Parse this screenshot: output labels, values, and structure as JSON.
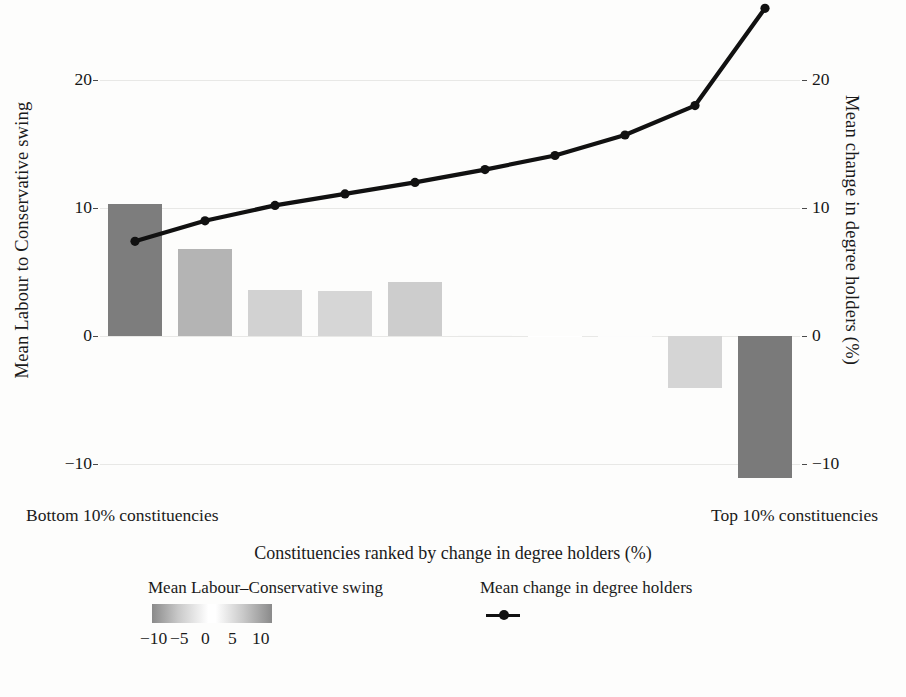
{
  "chart_data": {
    "type": "bar",
    "title": "",
    "subtitle": "",
    "xlabel": "Constituencies ranked by change in degree holders (%)",
    "ylabel_left": "Mean Labour to Conservative swing",
    "ylabel_right": "Mean change in degree holders (%)",
    "grid": true,
    "legend_position": "bottom",
    "x_end_labels": {
      "left": "Bottom 10% constituencies",
      "right": "Top 10% constituencies"
    },
    "categories": [
      "1",
      "2",
      "3",
      "4",
      "5",
      "6",
      "7",
      "8",
      "9",
      "10"
    ],
    "yaxis_left": {
      "ticks": [
        20,
        10,
        0,
        -10
      ],
      "tick_labels": [
        "20",
        "10",
        "0",
        "−10"
      ],
      "ylim": [
        -13.5,
        27.5
      ]
    },
    "yaxis_right": {
      "ticks": [
        20,
        10,
        0,
        -10
      ],
      "tick_labels": [
        "20",
        "10",
        "0",
        "−10"
      ],
      "ylim": [
        -13.5,
        27.5
      ]
    },
    "series": [
      {
        "name": "Mean Labour–Conservative swing",
        "type": "bar",
        "axis": "left",
        "values": [
          10.3,
          6.8,
          3.6,
          3.5,
          4.2,
          0.1,
          0.0,
          -0.1,
          -4.1,
          -11.1
        ],
        "fill_colors": [
          "#7d7d7d",
          "#b4b4b4",
          "#d2d2d2",
          "#d6d6d6",
          "#cdcdcd",
          "#fafafa",
          "#ffffff",
          "#fcfcfc",
          "#d5d5d5",
          "#7a7a7a"
        ]
      },
      {
        "name": "Mean change in degree holders",
        "type": "line",
        "axis": "right",
        "values": [
          7.4,
          9.0,
          10.2,
          11.1,
          12.0,
          13.0,
          14.1,
          15.7,
          18.0,
          25.6
        ],
        "color": "#111111",
        "marker": "circle"
      }
    ],
    "colorbar": {
      "label": "Mean Labour–Conservative swing",
      "ticks": [
        -10,
        -5,
        0,
        5,
        10
      ],
      "tick_labels": [
        "−10",
        "−5",
        "0",
        "5",
        "10"
      ],
      "low_color": "#8a8a8a",
      "mid_color": "#ffffff",
      "high_color": "#8a8a8a"
    }
  },
  "legend": {
    "swing_title": "Mean Labour–Conservative swing",
    "line_title": "Mean change in degree holders"
  },
  "colors": {
    "gridline": "#e8e8e6",
    "axis_text": "#161616",
    "line_series": "#111111",
    "background": "#fdfdfc"
  }
}
